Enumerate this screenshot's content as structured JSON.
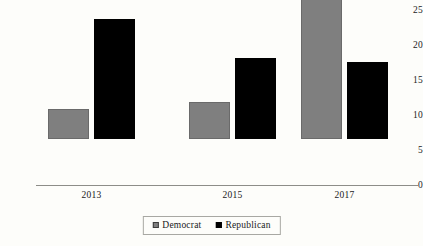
{
  "chart_data": {
    "type": "bar",
    "title": "",
    "subtitle": "",
    "xlabel": "",
    "ylabel": "",
    "categories": [
      "2013",
      "2015",
      "2017"
    ],
    "series": [
      {
        "name": "Democrat",
        "color": "#7f7f7f",
        "values": [
          4.3,
          5.3,
          23.0
        ]
      },
      {
        "name": "Republican",
        "color": "#000000",
        "values": [
          17.1,
          11.6,
          11.0
        ]
      }
    ],
    "ylim": [
      0,
      25
    ],
    "ytick_values": [
      0,
      5,
      10,
      15,
      20,
      25
    ],
    "ytick_labels": [
      "0",
      "5",
      "10",
      "15",
      "20",
      "25"
    ],
    "grid": false,
    "legend_position": "bottom-center",
    "legend": [
      {
        "label": "Democrat",
        "marker": "gray-square-marker"
      },
      {
        "label": "Republican",
        "marker": "black-square-marker"
      }
    ]
  }
}
